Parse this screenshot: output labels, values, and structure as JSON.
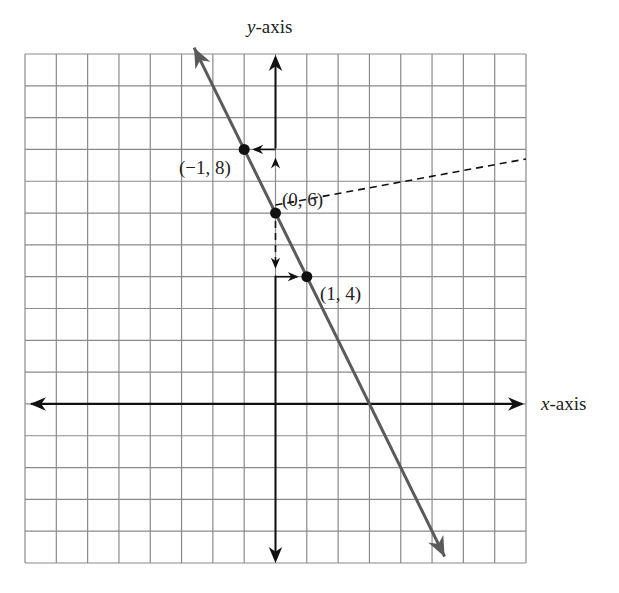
{
  "chart_data": {
    "type": "line",
    "title": "",
    "xlabel": "x-axis",
    "ylabel": "y-axis",
    "xlim": [
      -8,
      8
    ],
    "ylim": [
      -5,
      11
    ],
    "grid": true,
    "grid_spacing": 1,
    "series": [
      {
        "name": "y = -2x + 6",
        "points": [
          {
            "x": -1,
            "y": 8,
            "label": "(−1, 8)"
          },
          {
            "x": 0,
            "y": 6,
            "label": "(0, 6)"
          },
          {
            "x": 1,
            "y": 4,
            "label": "(1, 4)"
          }
        ],
        "line_extends": {
          "from": [
            -2.6,
            11.2
          ],
          "to": [
            5.4,
            -4.8
          ]
        },
        "color": "#555555"
      }
    ],
    "annotations": [
      "dashed arrow from y-axis at x=0: up to y=8 then left to (-1, 8)",
      "dashed arrow from y-axis at x=0: down to y=4 then right to (1, 4)"
    ]
  },
  "labels": {
    "x_axis": "x",
    "x_axis_suffix": "-axis",
    "y_axis": "y",
    "y_axis_suffix": "-axis",
    "p1": "(−1, 8)",
    "p2": "(0, 6)",
    "p3": "(1, 4)"
  },
  "colors": {
    "grid": "#8a8a8a",
    "axis": "#111111",
    "line": "#5a5a5a",
    "point": "#111111"
  }
}
